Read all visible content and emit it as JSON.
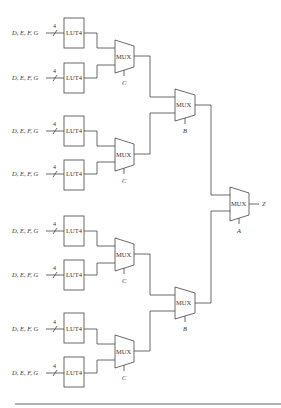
{
  "diagram": {
    "type": "multiplexer tree",
    "luts": [
      {
        "id": "lut1",
        "label": "LUT4",
        "input": "D, E, F, G",
        "width": "4",
        "y": 18
      },
      {
        "id": "lut2",
        "label": "LUT4",
        "input": "D, E, F, G",
        "width": "4",
        "y": 63
      },
      {
        "id": "lut3",
        "label": "LUT4",
        "input": "D, E, F, G",
        "width": "4",
        "y": 116
      },
      {
        "id": "lut4",
        "label": "LUT4",
        "input": "D, E, F, G",
        "width": "4",
        "y": 160
      },
      {
        "id": "lut5",
        "label": "LUT4",
        "input": "D, E, F, G",
        "width": "4",
        "y": 216
      },
      {
        "id": "lut6",
        "label": "LUT4",
        "input": "D, E, F, G",
        "width": "4",
        "y": 260
      },
      {
        "id": "lut7",
        "label": "LUT4",
        "input": "D, E, F, G",
        "width": "4",
        "y": 313
      },
      {
        "id": "lut8",
        "label": "LUT4",
        "input": "D, E, F, G",
        "width": "4",
        "y": 357
      }
    ],
    "muxes": [
      {
        "id": "mux1",
        "label": "MUX",
        "select": "C"
      },
      {
        "id": "mux2",
        "label": "MUX",
        "select": "C"
      },
      {
        "id": "mux3",
        "label": "MUX",
        "select": "C"
      },
      {
        "id": "mux4",
        "label": "MUX",
        "select": "C"
      },
      {
        "id": "mux5",
        "label": "MUX",
        "select": "B"
      },
      {
        "id": "mux6",
        "label": "MUX",
        "select": "B"
      },
      {
        "id": "mux7",
        "label": "MUX",
        "select": "A"
      }
    ],
    "output": "Z"
  }
}
